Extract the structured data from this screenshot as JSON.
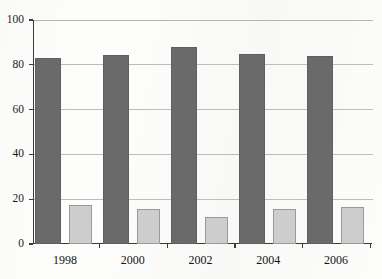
{
  "chart_data": {
    "type": "bar",
    "title": "",
    "subtitle": "",
    "xlabel": "",
    "ylabel": "",
    "categories": [
      "1998",
      "2000",
      "2002",
      "2004",
      "2006"
    ],
    "series": [
      {
        "name": "series-1",
        "color": "#6a6a6a",
        "values": [
          83,
          84.5,
          88,
          85,
          84
        ]
      },
      {
        "name": "series-2",
        "color": "#cdcdcd",
        "values": [
          17.5,
          15.5,
          12,
          15.5,
          16.5
        ]
      }
    ],
    "ylim": [
      0,
      100
    ],
    "yticks": [
      "0",
      "20",
      "40",
      "60",
      "80",
      "100"
    ],
    "ytick_values": [
      0,
      20,
      40,
      60,
      80,
      100
    ],
    "grid": true,
    "grid_axis": "y",
    "legend": false,
    "legend_position": "none",
    "annotations": []
  },
  "axes": {
    "y_axis_name": "y-axis",
    "x_axis_name": "x-axis"
  },
  "style": {
    "background": "#fdfdfc",
    "axis_color": "#3a3a3a",
    "grid_color": "#bdbdbd",
    "bar_dark": "#6a6a6a",
    "bar_light": "#cdcdcd"
  }
}
